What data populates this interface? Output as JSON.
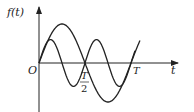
{
  "labels": {
    "y_axis": "f(t)",
    "x_axis": "t",
    "origin": "O",
    "half_period_num": "T",
    "half_period_den": "2",
    "period": "T"
  },
  "colors": {
    "stroke": "#222222",
    "background": "#ffffff"
  },
  "chart_data": {
    "type": "line",
    "title": "",
    "xlabel": "t",
    "ylabel": "f(t)",
    "x_ticks": [
      "O",
      "T/2",
      "T"
    ],
    "series": [
      {
        "name": "large-amplitude sine",
        "formula": "A·sin(2πt/T)",
        "period": "T",
        "relative_amplitude": 1.0
      },
      {
        "name": "small-amplitude sine",
        "formula": "a·sin(4πt/T)",
        "period": "T/2",
        "relative_amplitude": 0.6
      }
    ],
    "grid": false
  }
}
